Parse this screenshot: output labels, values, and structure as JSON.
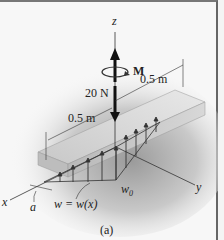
{
  "figure": {
    "caption": "(a)",
    "axes": {
      "x": "x",
      "y": "y",
      "z": "z"
    },
    "loads": {
      "force": "20 N",
      "moment": "M",
      "distributed_load": "w = w(x)",
      "max_intensity": "w",
      "max_intensity_subscript": "0"
    },
    "dimensions": {
      "length_1": "0.5 m",
      "length_2": "0.5 m",
      "offset": "a"
    }
  }
}
